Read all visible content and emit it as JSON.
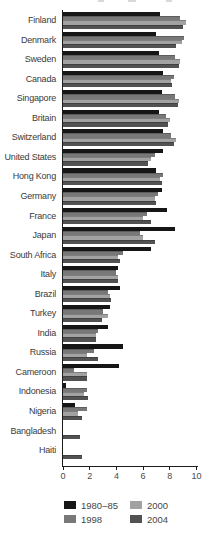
{
  "chart_data": {
    "type": "bar",
    "orientation": "horizontal",
    "title": "",
    "xlabel": "",
    "ylabel": "",
    "axis": {
      "min": 0,
      "max": 10,
      "ticks": [
        0,
        2,
        4,
        6,
        8,
        10
      ]
    },
    "grid": false,
    "legend_position": "bottom",
    "series_names": [
      "1980–85",
      "1998",
      "2000",
      "2004"
    ],
    "series_colors": [
      "#161616",
      "#787878",
      "#a2a2a2",
      "#525252"
    ],
    "categories": [
      "Finland",
      "Denmark",
      "Sweden",
      "Canada",
      "Singapore",
      "Britain",
      "Switzerland",
      "United States",
      "Hong Kong",
      "Germany",
      "France",
      "Japan",
      "South Africa",
      "Italy",
      "Brazil",
      "Turkey",
      "India",
      "Russia",
      "Cameroon",
      "Indonesia",
      "Nigeria",
      "Bangladesh",
      "Haiti"
    ],
    "countries": [
      {
        "name": "Finland",
        "values": [
          7.3,
          8.8,
          9.2,
          9.0
        ]
      },
      {
        "name": "Denmark",
        "values": [
          7.0,
          9.1,
          8.9,
          8.5
        ]
      },
      {
        "name": "Sweden",
        "values": [
          7.2,
          8.4,
          8.8,
          8.7
        ]
      },
      {
        "name": "Canada",
        "values": [
          7.5,
          8.3,
          8.1,
          8.2
        ]
      },
      {
        "name": "Singapore",
        "values": [
          7.4,
          8.4,
          8.7,
          8.6
        ]
      },
      {
        "name": "Britain",
        "values": [
          7.2,
          7.7,
          8.0,
          7.9
        ]
      },
      {
        "name": "Switzerland",
        "values": [
          7.5,
          8.1,
          8.5,
          8.3
        ]
      },
      {
        "name": "United States",
        "values": [
          7.5,
          6.9,
          6.6,
          6.4
        ]
      },
      {
        "name": "Hong Kong",
        "values": [
          7.0,
          7.5,
          7.3,
          7.4
        ]
      },
      {
        "name": "Germany",
        "values": [
          7.4,
          7.1,
          6.9,
          7.0
        ]
      },
      {
        "name": "France",
        "values": [
          7.8,
          6.3,
          6.0,
          6.6
        ]
      },
      {
        "name": "Japan",
        "values": [
          8.4,
          5.8,
          6.0,
          6.9
        ]
      },
      {
        "name": "South Africa",
        "values": [
          6.6,
          4.5,
          4.1,
          4.3
        ]
      },
      {
        "name": "Italy",
        "values": [
          4.1,
          4.0,
          4.1,
          4.1
        ]
      },
      {
        "name": "Brazil",
        "values": [
          4.3,
          3.4,
          3.5,
          3.6
        ]
      },
      {
        "name": "Turkey",
        "values": [
          3.5,
          3.0,
          3.4,
          2.9
        ]
      },
      {
        "name": "India",
        "values": [
          3.4,
          2.6,
          2.5,
          2.5
        ]
      },
      {
        "name": "Russia",
        "values": [
          4.5,
          2.3,
          1.8,
          2.6
        ]
      },
      {
        "name": "Cameroon",
        "values": [
          4.2,
          0.8,
          1.8,
          1.8
        ]
      },
      {
        "name": "Indonesia",
        "values": [
          0.2,
          1.8,
          1.6,
          1.9
        ]
      },
      {
        "name": "Nigeria",
        "values": [
          0.9,
          1.8,
          1.1,
          1.4
        ]
      },
      {
        "name": "Bangladesh",
        "values": [
          null,
          null,
          null,
          1.3
        ]
      },
      {
        "name": "Haiti",
        "values": [
          null,
          null,
          null,
          1.4
        ]
      }
    ],
    "legend": {
      "items": [
        {
          "label": "1980–85",
          "color": "#161616"
        },
        {
          "label": "1998",
          "color": "#787878"
        },
        {
          "label": "2000",
          "color": "#a2a2a2"
        },
        {
          "label": "2004",
          "color": "#525252"
        }
      ]
    }
  }
}
